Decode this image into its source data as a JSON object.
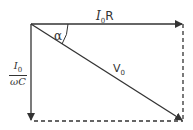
{
  "diagram": {
    "labels": {
      "horizontal": {
        "main": "I",
        "sub": "0",
        "suffix": "R"
      },
      "vertical": {
        "numerator_main": "I",
        "numerator_sub": "0",
        "denominator": "ωC"
      },
      "diagonal": {
        "main": "V",
        "sub": "0"
      },
      "angle": "α"
    },
    "colors": {
      "line": "#333333",
      "background": "#ffffff"
    }
  }
}
